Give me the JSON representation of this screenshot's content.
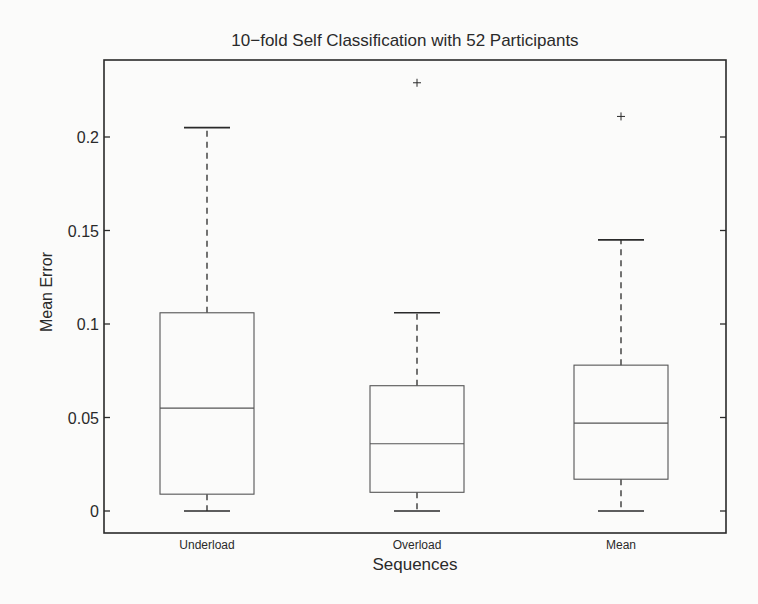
{
  "chart_data": {
    "type": "boxplot",
    "title": "10−fold Self Classification with 52 Participants",
    "xlabel": "Sequences",
    "ylabel": "Mean Error",
    "ylim": [
      -0.012,
      0.253
    ],
    "yticks": [
      0,
      0.05,
      0.1,
      0.15,
      0.2
    ],
    "ytick_labels": [
      "0",
      "0.05",
      "0.1",
      "0.15",
      "0.2"
    ],
    "grid": false,
    "legend": null,
    "categories": [
      "Underload",
      "Overload",
      "Mean"
    ],
    "boxes": [
      {
        "name": "Underload",
        "whisker_low": 0.0,
        "q1": 0.009,
        "median": 0.055,
        "q3": 0.106,
        "whisker_high": 0.205,
        "outliers": []
      },
      {
        "name": "Overload",
        "whisker_low": 0.0,
        "q1": 0.01,
        "median": 0.036,
        "q3": 0.067,
        "whisker_high": 0.106,
        "outliers": [
          0.229
        ]
      },
      {
        "name": "Mean",
        "whisker_low": 0.0,
        "q1": 0.017,
        "median": 0.047,
        "q3": 0.078,
        "whisker_high": 0.145,
        "outliers": [
          0.211
        ]
      }
    ],
    "colors": {
      "axis": "#2a2a2a",
      "box": "#555555",
      "background": "#fbfbfa"
    }
  }
}
